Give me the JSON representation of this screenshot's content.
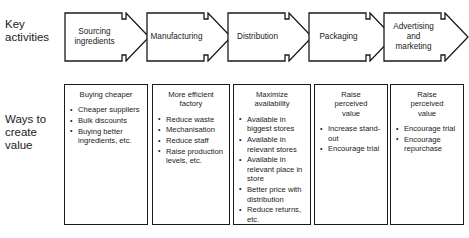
{
  "diagram": {
    "rows": [
      {
        "id": "key-activities",
        "label": "Key\nactivities"
      },
      {
        "id": "ways-to-create-value",
        "label": "Ways to\ncreate\nvalue"
      }
    ],
    "stages": [
      {
        "arrow_label": "Sourcing\ningredients",
        "box_title": "Buying cheaper",
        "bullets": [
          "Cheaper suppliers",
          "Bulk discounts",
          "Buying better ingredients, etc."
        ]
      },
      {
        "arrow_label": "Manufacturing",
        "box_title": "More efficient\nfactory",
        "bullets": [
          "Reduce waste",
          "Mechanisation",
          "Reduce staff",
          "Raise production levels, etc."
        ]
      },
      {
        "arrow_label": "Distribution",
        "box_title": "Maximize\navailability",
        "bullets": [
          "Available in biggest stores",
          "Available in relevant stores",
          "Available in relevant place in store",
          "Better price with distribution",
          "Reduce returns, etc."
        ]
      },
      {
        "arrow_label": "Packaging",
        "box_title": "Raise\nperceived\nvalue",
        "bullets": [
          "Increase stand-out",
          "Encourage trial"
        ]
      },
      {
        "arrow_label": "Advertising\nand\nmarketing",
        "box_title": "Raise\nperceived\nvalue",
        "bullets": [
          "Encourage trial",
          "Encourage repurchase"
        ]
      }
    ],
    "colors": {
      "stroke": "#1a1a1a",
      "fill": "#ffffff",
      "background": "#ffffff"
    }
  }
}
